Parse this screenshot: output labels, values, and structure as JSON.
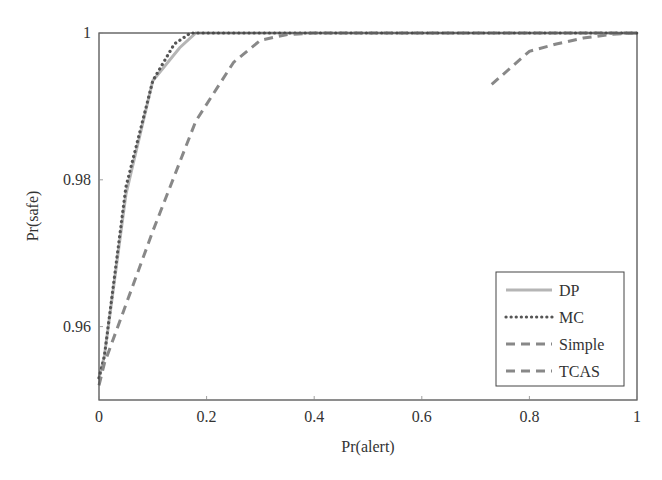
{
  "chart_data": {
    "type": "line",
    "title": "",
    "xlabel": "Pr(alert)",
    "ylabel": "Pr(safe)",
    "xlim": [
      0,
      1
    ],
    "ylim": [
      0.95,
      1
    ],
    "xticks": [
      "0",
      "0.2",
      "0.4",
      "0.6",
      "0.8",
      "1"
    ],
    "yticks": [
      "0.96",
      "0.98",
      "1"
    ],
    "grid": false,
    "legend_position": "lower right",
    "series": [
      {
        "name": "DP",
        "style": "solid",
        "color": "#b5b5b5",
        "x": [
          0,
          0.01,
          0.05,
          0.1,
          0.15,
          0.18,
          1
        ],
        "y": [
          0.953,
          0.956,
          0.978,
          0.9935,
          0.998,
          1.0,
          1.0
        ]
      },
      {
        "name": "MC",
        "style": "dotted",
        "color": "#555555",
        "x": [
          0,
          0.01,
          0.05,
          0.1,
          0.14,
          0.17,
          1
        ],
        "y": [
          0.953,
          0.956,
          0.979,
          0.9935,
          0.9985,
          1.0,
          1.0
        ]
      },
      {
        "name": "Simple",
        "style": "dashed",
        "color": "#888888",
        "x": [
          0,
          0.01,
          0.1,
          0.18,
          0.25,
          0.3,
          0.35,
          0.4,
          1
        ],
        "y": [
          0.952,
          0.955,
          0.973,
          0.988,
          0.996,
          0.999,
          0.9998,
          1.0,
          1.0
        ]
      },
      {
        "name": "TCAS",
        "style": "dashed",
        "color": "#888888",
        "x": [
          0.73,
          0.8,
          0.85,
          0.9,
          0.95,
          1
        ],
        "y": [
          0.993,
          0.9975,
          0.9985,
          0.9993,
          0.9998,
          1.0
        ]
      }
    ]
  }
}
